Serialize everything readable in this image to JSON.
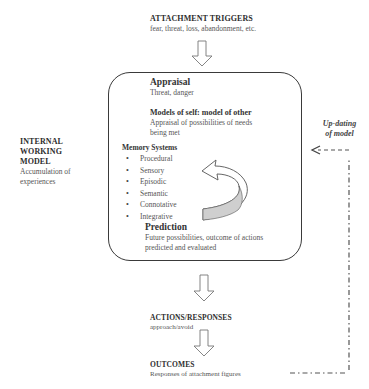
{
  "diagram": {
    "triggers": {
      "title": "ATTACHMENT TRIGGERS",
      "subtitle": "fear, threat, loss, abandonment, etc."
    },
    "internal_working_model": {
      "title_lines": [
        "INTERNAL",
        "WORKING",
        "MODEL"
      ],
      "subtitle_lines": [
        "Accumulation of",
        "experiences"
      ]
    },
    "central_box": {
      "appraisal": {
        "title": "Appraisal",
        "subtitle": "Threat,  danger"
      },
      "models": {
        "title": "Models of self: model of other",
        "subtitle_lines": [
          "Appraisal of possibilities of needs",
          "being met"
        ]
      },
      "memory_systems": {
        "title": "Memory Systems",
        "items": [
          "Procedural",
          "Sensory",
          "Episodic",
          "Semantic",
          "Connotative",
          "Integrative"
        ]
      },
      "prediction": {
        "title": "Prediction",
        "subtitle_lines": [
          "Future possibilities, outcome of actions",
          "predicted and evaluated"
        ]
      }
    },
    "updating": {
      "label_lines": [
        "Up-dating",
        "of model"
      ]
    },
    "actions": {
      "title": "ACTIONS/RESPONSES",
      "subtitle": "approach/avoid"
    },
    "outcomes": {
      "title": "OUTCOMES",
      "subtitle": "Responses of attachment figures"
    },
    "colors": {
      "line": "#3a3a3a",
      "arrow_fill": "#ffffff",
      "curved_arrow_shade": "#cfcfcf"
    }
  }
}
